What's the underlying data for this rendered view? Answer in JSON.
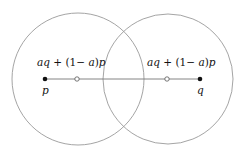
{
  "diagram": {
    "circles": [
      {
        "name": "left",
        "cx": 78,
        "cy": 79,
        "r": 66,
        "stroke": "#9a9a9a"
      },
      {
        "name": "right",
        "cx": 168,
        "cy": 79,
        "r": 65,
        "stroke": "#9a9a9a"
      }
    ],
    "segment": {
      "x1": 45,
      "y1": 79,
      "x2": 200,
      "y2": 79,
      "stroke": "#777777"
    },
    "points": {
      "p": {
        "label": "p",
        "x": 45,
        "y": 79
      },
      "q": {
        "label": "q",
        "x": 200,
        "y": 79
      }
    },
    "interpolated_points": [
      {
        "x": 77,
        "y": 79,
        "label_parts": [
          "aq",
          " + (1− ",
          "a",
          ")",
          "p"
        ]
      },
      {
        "x": 167,
        "y": 79,
        "label_parts": [
          "aq",
          " + (1− ",
          "a",
          ")",
          "p"
        ]
      }
    ],
    "labels": {
      "left_expr": "aq + (1− a)p",
      "right_expr": "aq + (1− a)p",
      "p": "p",
      "q": "q"
    }
  }
}
